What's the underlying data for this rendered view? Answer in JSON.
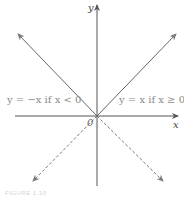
{
  "figure": {
    "axes": {
      "x_label": "x",
      "y_label": "y",
      "origin_label": "0"
    },
    "pieces": [
      {
        "label": "y = −x if x < 0",
        "style": "solid",
        "direction": "upper-left"
      },
      {
        "label": "y = x if x ≥ 0",
        "style": "solid",
        "direction": "upper-right"
      },
      {
        "style": "dashed",
        "direction": "lower-left"
      },
      {
        "style": "dashed",
        "direction": "lower-right"
      }
    ],
    "caption": "FIGURE 1.10",
    "colors": {
      "axis": "#555555",
      "curve": "#666666",
      "label": "#8a8a8a"
    }
  }
}
